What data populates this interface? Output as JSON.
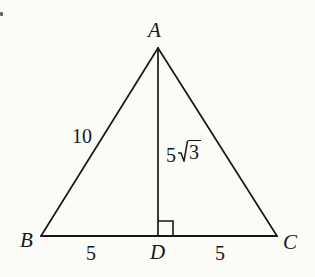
{
  "figure": {
    "kind": "geometry-diagram",
    "background_color": "#fbfbf8",
    "stroke_color": "#17171a",
    "stroke_width": 1.6
  },
  "vertices": {
    "a": {
      "label": "A",
      "x": 158,
      "y": 48
    },
    "b": {
      "label": "B",
      "x": 41,
      "y": 236
    },
    "c": {
      "label": "C",
      "x": 277,
      "y": 236
    },
    "d": {
      "label": "D",
      "x": 158,
      "y": 236
    }
  },
  "segments": {
    "side_ab": {
      "label": "10",
      "from": "B",
      "to": "A"
    },
    "side_ac": {
      "label": "",
      "from": "A",
      "to": "C"
    },
    "base_bc": {
      "label": "",
      "from": "B",
      "to": "C"
    },
    "altitude_ad": {
      "label": "5√3",
      "coefficient": "5",
      "radicand": "3",
      "from": "A",
      "to": "D"
    },
    "segment_bd": {
      "label": "5",
      "from": "B",
      "to": "D"
    },
    "segment_dc": {
      "label": "5",
      "from": "D",
      "to": "C"
    }
  },
  "markers": {
    "right_angle": {
      "name": "right-angle-mark",
      "at_vertex": "D",
      "size": 14,
      "side": "right"
    }
  }
}
